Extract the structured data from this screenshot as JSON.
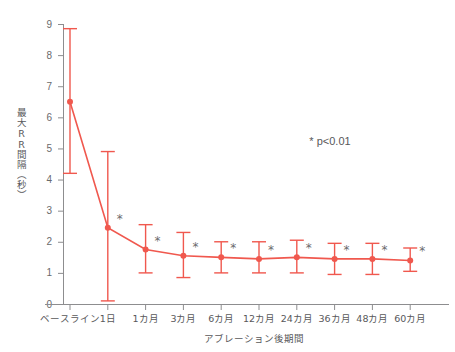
{
  "chart_data": {
    "type": "line",
    "title": "",
    "xlabel": "アブレーション後期間",
    "ylabel": "最大RR間隔（秒）",
    "categories": [
      "ベースライン",
      "1日",
      "1カ月",
      "3カ月",
      "6カ月",
      "12カ月",
      "24カ月",
      "36カ月",
      "48カ月",
      "60カ月"
    ],
    "values": [
      6.5,
      2.45,
      1.75,
      1.55,
      1.5,
      1.45,
      1.5,
      1.45,
      1.45,
      1.4
    ],
    "error_upper": [
      8.85,
      4.9,
      2.55,
      2.3,
      2.0,
      2.0,
      2.05,
      1.95,
      1.95,
      1.8
    ],
    "error_lower": [
      4.2,
      0.1,
      1.0,
      0.85,
      1.0,
      1.0,
      1.0,
      0.95,
      0.95,
      1.05
    ],
    "significance": [
      "",
      "*",
      "*",
      "*",
      "*",
      "*",
      "*",
      "*",
      "*",
      "*"
    ],
    "ylim": [
      0,
      9
    ],
    "yticks": [
      "0",
      "1",
      "2",
      "3",
      "4",
      "5",
      "6",
      "7",
      "8",
      "9"
    ],
    "grid": false,
    "legend_position": "none",
    "annotation": "* p<0.01",
    "series_color": "#f0584e"
  },
  "colors": {
    "series": "#f0584e",
    "axis": "#8d8d8f",
    "text": "#58585a",
    "star": "#6b6b6d",
    "background": "#ffffff"
  }
}
